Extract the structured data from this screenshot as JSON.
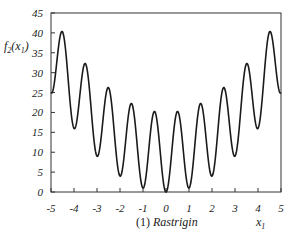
{
  "chart_data": {
    "type": "line",
    "title": "(1) Rastrigin",
    "caption_prefix": "(1)",
    "caption_name": "Rastrigin",
    "xlabel": "x1",
    "xlabel_base": "x",
    "xlabel_sub": "1",
    "ylabel": "f2(x1)",
    "ylabel_f": "f",
    "ylabel_sub": "2",
    "ylabel_arg": "x",
    "ylabel_arg_sub": "1",
    "xlim": [
      -5,
      5
    ],
    "ylim": [
      0,
      45
    ],
    "grid": false,
    "legend": null,
    "x_ticks": [
      "-5",
      "-4",
      "-3",
      "-2",
      "-1",
      "0",
      "1",
      "2",
      "3",
      "4",
      "5"
    ],
    "y_ticks": [
      "0",
      "5",
      "10",
      "15",
      "20",
      "25",
      "30",
      "35",
      "40",
      "45"
    ],
    "function": "f(x) = 10 + x^2 - 10cos(2*pi*x)",
    "series": [
      {
        "name": "Rastrigin",
        "color": "#1a1a1a",
        "x": [
          -5,
          -4.5,
          -4,
          -3.5,
          -3,
          -2.5,
          -2,
          -1.5,
          -1,
          -0.5,
          0,
          0.5,
          1,
          1.5,
          2,
          2.5,
          3,
          3.5,
          4,
          4.5,
          5
        ],
        "values": [
          25,
          40.25,
          16,
          32.25,
          9,
          26.25,
          4,
          22.25,
          1,
          20.25,
          0,
          20.25,
          1,
          22.25,
          4,
          26.25,
          9,
          32.25,
          16,
          40.25,
          25
        ]
      }
    ],
    "plot_area": {
      "left": 51,
      "right": 281,
      "top": 13,
      "bottom": 192
    }
  }
}
